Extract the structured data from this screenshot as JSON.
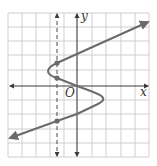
{
  "figure": {
    "type": "vertical-line-test graph",
    "axis_labels": {
      "x": "x",
      "y": "y",
      "origin": "O"
    },
    "grid": {
      "left": 8,
      "top": 13,
      "right": 149,
      "bottom": 157,
      "cell": 14.1
    },
    "origin_px": [
      77,
      86
    ],
    "colors": {
      "grid": "#c9c9c9",
      "axis": "#3c3c3c",
      "curve": "#6a6a6a",
      "dashed": "#4a4a4a",
      "point": "#6a6a6a"
    },
    "dashed_line_x_px": 57,
    "intersection_points": [
      {
        "label": "upper",
        "px": [
          57,
          63
        ]
      },
      {
        "label": "middle",
        "px": [
          57,
          78
        ]
      },
      {
        "label": "lower",
        "px": [
          57,
          121
        ]
      }
    ]
  }
}
